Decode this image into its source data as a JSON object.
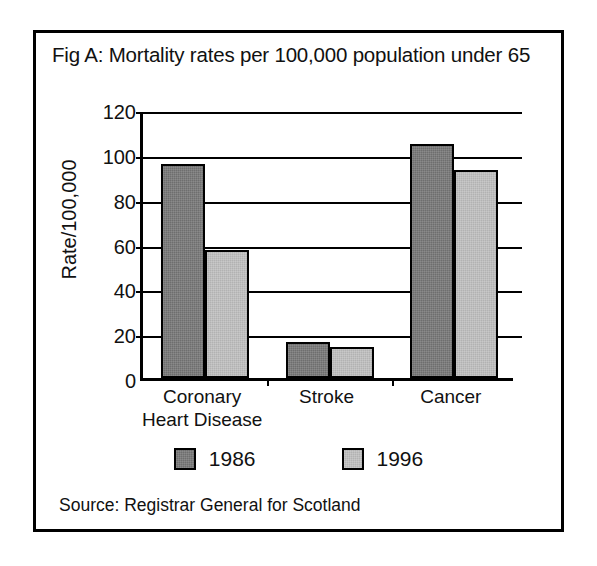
{
  "figure": {
    "title": "Fig A: Mortality rates per 100,000 population under 65",
    "source": "Source: Registrar General for Scotland"
  },
  "chart_data": {
    "type": "bar",
    "title": "Fig A: Mortality rates per 100,000 population under 65",
    "xlabel": "",
    "ylabel": "Rate/100,000",
    "ylim": [
      0,
      120
    ],
    "ytick_step": 20,
    "yticks": [
      0,
      20,
      40,
      60,
      80,
      100,
      120
    ],
    "ytick_labels": [
      "0",
      "20",
      "40",
      "60",
      "80",
      "100",
      "120"
    ],
    "grid": true,
    "legend_position": "bottom",
    "categories": [
      "Coronary Heart Disease",
      "Stroke",
      "Cancer"
    ],
    "category_label_lines": [
      [
        "Coronary",
        "Heart Disease"
      ],
      [
        "Stroke"
      ],
      [
        "Cancer"
      ]
    ],
    "series": [
      {
        "name": "1986",
        "color": "#6e6e6e",
        "values": [
          95.5,
          16,
          104.5
        ]
      },
      {
        "name": "1996",
        "color": "#b2b2b2",
        "values": [
          57,
          14,
          93
        ]
      }
    ],
    "source": "Source: Registrar General for Scotland"
  },
  "legend": {
    "items": [
      {
        "label": "1986",
        "swatch": "dark-grey-swatch"
      },
      {
        "label": "1996",
        "swatch": "light-grey-swatch"
      }
    ]
  },
  "colors": {
    "series_1986": "#6e6e6e",
    "series_1996": "#b2b2b2",
    "axis": "#000000",
    "background": "#ffffff"
  }
}
